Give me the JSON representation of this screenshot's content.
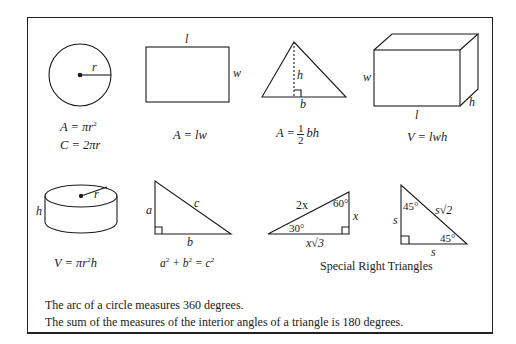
{
  "reference_sheet": {
    "figures": [
      {
        "name": "circle",
        "labels": {
          "radius": "r"
        },
        "formulas": [
          "A = πr²",
          "C = 2πr"
        ]
      },
      {
        "name": "rectangle",
        "labels": {
          "length": "l",
          "width": "w"
        },
        "formulas": [
          "A = lw"
        ]
      },
      {
        "name": "triangle",
        "labels": {
          "height": "h",
          "base": "b"
        },
        "formulas": [
          "A = 1/2 bh"
        ]
      },
      {
        "name": "rectangular-prism",
        "labels": {
          "width": "w",
          "length": "l",
          "height": "h"
        },
        "formulas": [
          "V = lwh"
        ]
      },
      {
        "name": "cylinder",
        "labels": {
          "height": "h",
          "radius": "r"
        },
        "formulas": [
          "V = πr²h"
        ]
      },
      {
        "name": "right-triangle",
        "labels": {
          "leg_a": "a",
          "leg_b": "b",
          "hypotenuse": "c"
        },
        "formulas": [
          "a² + b² = c²"
        ]
      },
      {
        "name": "30-60-90-triangle",
        "labels": {
          "hypotenuse": "2x",
          "short_leg": "x",
          "long_leg": "x√3",
          "angle_top": "60°",
          "angle_left": "30°"
        }
      },
      {
        "name": "45-45-90-triangle",
        "labels": {
          "leg_vertical": "s",
          "leg_horizontal": "s",
          "hypotenuse": "s√2",
          "angle_top": "45°",
          "angle_right": "45°"
        }
      }
    ],
    "formula_parts": {
      "circle_area": {
        "lhs": "A = πr",
        "exp": "2"
      },
      "circle_circ": "C = 2πr",
      "rect_area": "A = lw",
      "tri_area": {
        "lhs": "A =",
        "num": "1",
        "den": "2",
        "rhs": "bh"
      },
      "prism_vol": "V = lwh",
      "cyl_vol": {
        "lhs": "V = πr",
        "exp": "2",
        "rhs": "h"
      },
      "pyth": {
        "a": "a",
        "b": "b",
        "c": "c",
        "exp": "2"
      }
    },
    "special_right_triangles_caption": "Special Right Triangles",
    "notes": [
      "The arc of a circle measures 360 degrees.",
      "The sum of the measures of the interior angles of a triangle is 180 degrees."
    ]
  }
}
